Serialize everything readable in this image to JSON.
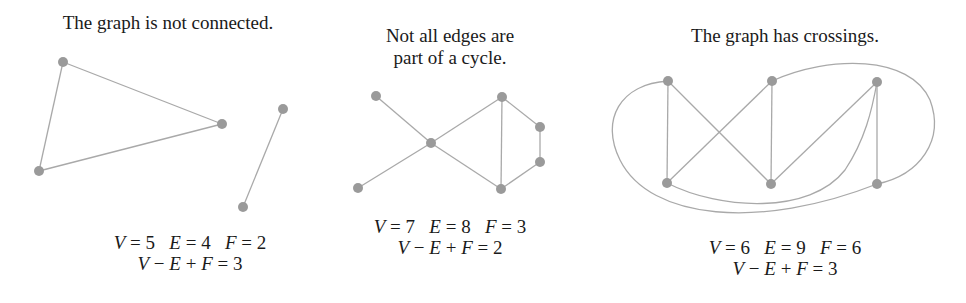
{
  "colors": {
    "edge": "#a9a9a9",
    "node": "#9a9a9a",
    "text": "#1a1a1a"
  },
  "panels": [
    {
      "caption": "The graph is not connected.",
      "caption_lines": [
        "The graph is not connected."
      ],
      "counts_line": "V = 5   E = 4   F = 2",
      "euler_line": "V − E + F = 3",
      "V": 5,
      "E": 4,
      "F": 2,
      "euler": 3,
      "nodes": [
        [
          63,
          62
        ],
        [
          222,
          124
        ],
        [
          39,
          171
        ],
        [
          283,
          109
        ],
        [
          243,
          207
        ]
      ],
      "edges": [
        [
          0,
          1
        ],
        [
          1,
          2
        ],
        [
          2,
          0
        ],
        [
          3,
          4
        ]
      ],
      "curves": []
    },
    {
      "caption": "Not all edges are part of a cycle.",
      "caption_lines": [
        "Not all edges are",
        "part of a cycle."
      ],
      "counts_line": "V = 7   E = 8   F = 3",
      "euler_line": "V − E + F = 2",
      "V": 7,
      "E": 8,
      "F": 3,
      "euler": 2,
      "nodes": [
        [
          376,
          96
        ],
        [
          431,
          143
        ],
        [
          358,
          188
        ],
        [
          502,
          97
        ],
        [
          540,
          127
        ],
        [
          540,
          162
        ],
        [
          501,
          189
        ]
      ],
      "edges": [
        [
          0,
          1
        ],
        [
          1,
          2
        ],
        [
          1,
          3
        ],
        [
          1,
          6
        ],
        [
          3,
          6
        ],
        [
          3,
          4
        ],
        [
          4,
          5
        ],
        [
          5,
          6
        ]
      ],
      "curves": []
    },
    {
      "caption": "The graph has crossings.",
      "caption_lines": [
        "The graph has crossings."
      ],
      "counts_line": "V = 6   E = 9   F = 6",
      "euler_line": "V − E + F = 3",
      "V": 6,
      "E": 9,
      "F": 6,
      "euler": 3,
      "nodes": [
        [
          668,
          81
        ],
        [
          772,
          81
        ],
        [
          877,
          82
        ],
        [
          667,
          183
        ],
        [
          771,
          184
        ],
        [
          877,
          184
        ]
      ],
      "edges": [
        [
          0,
          3
        ],
        [
          0,
          4
        ],
        [
          1,
          3
        ],
        [
          1,
          4
        ],
        [
          2,
          4
        ],
        [
          2,
          5
        ]
      ],
      "curves": [
        "M668,81 C620,84 600,120 620,160 C650,220 760,230 877,184",
        "M772,81 C830,55 910,55 930,100 C945,140 920,175 877,184",
        "M667,183 C720,210 810,215 845,170 C865,140 872,110 877,82"
      ]
    }
  ]
}
